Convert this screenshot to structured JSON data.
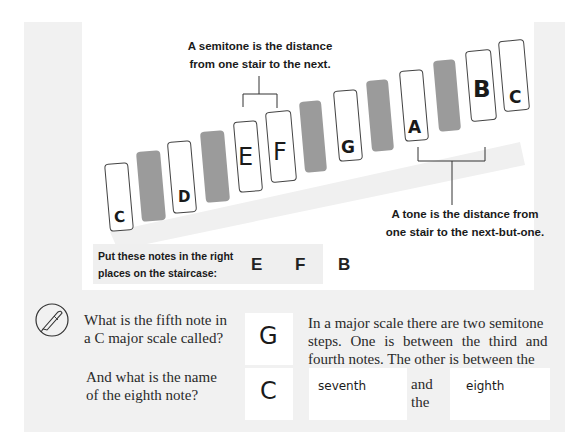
{
  "diagram": {
    "semitone_caption": [
      "A semitone is the distance",
      "from one stair to the next."
    ],
    "tone_caption": [
      "A tone is the distance from",
      "one stair to the next-but-one."
    ],
    "stairs": [
      {
        "type": "white",
        "label": "C"
      },
      {
        "type": "black",
        "label": ""
      },
      {
        "type": "white",
        "label": "D"
      },
      {
        "type": "black",
        "label": ""
      },
      {
        "type": "white",
        "label": "E"
      },
      {
        "type": "white",
        "label": "F"
      },
      {
        "type": "black",
        "label": ""
      },
      {
        "type": "white",
        "label": "G"
      },
      {
        "type": "black",
        "label": ""
      },
      {
        "type": "white",
        "label": "A"
      },
      {
        "type": "black",
        "label": ""
      },
      {
        "type": "white",
        "label": "B"
      },
      {
        "type": "white",
        "label": "C"
      }
    ]
  },
  "exercise": {
    "instruction": [
      "Put these notes in the right",
      "places on the staircase:"
    ],
    "notes": [
      "E",
      "F",
      "B"
    ]
  },
  "questions": {
    "q1": [
      "What is the fifth note in",
      "a C major scale called?"
    ],
    "a1": "G",
    "q2": [
      "And what is the name",
      "of the eighth note?"
    ],
    "a2": "C",
    "q3": [
      "In a major scale there are two semitone",
      "steps. One is between the third and",
      "fourth notes. The other is between the"
    ],
    "a3_first": "seventh",
    "connector": [
      "and",
      "the"
    ],
    "a3_second": "eighth"
  },
  "colors": {
    "panel_bg": "#f1f1f1",
    "white_stair": "#ffffff",
    "black_stair": "#9b9b9b"
  }
}
